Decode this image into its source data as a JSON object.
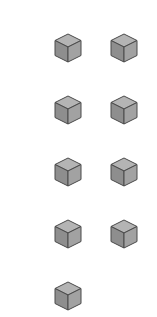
{
  "figure": {
    "cube_count": 9,
    "columns": 2,
    "rows": 5,
    "colors": {
      "top": "#b4b4b4",
      "left": "#8e8e8e",
      "right": "#a2a2a2",
      "edge": "#4a4a4a",
      "background": "#ffffff"
    },
    "cubes": [
      {
        "id": 1,
        "row": 1,
        "col": 1,
        "x": 54,
        "y": 33
      },
      {
        "id": 2,
        "row": 1,
        "col": 2,
        "x": 110,
        "y": 33
      },
      {
        "id": 3,
        "row": 2,
        "col": 1,
        "x": 54,
        "y": 95
      },
      {
        "id": 4,
        "row": 2,
        "col": 2,
        "x": 110,
        "y": 95
      },
      {
        "id": 5,
        "row": 3,
        "col": 1,
        "x": 54,
        "y": 157
      },
      {
        "id": 6,
        "row": 3,
        "col": 2,
        "x": 110,
        "y": 157
      },
      {
        "id": 7,
        "row": 4,
        "col": 1,
        "x": 54,
        "y": 219
      },
      {
        "id": 8,
        "row": 4,
        "col": 2,
        "x": 110,
        "y": 219
      },
      {
        "id": 9,
        "row": 5,
        "col": 1,
        "x": 54,
        "y": 281
      }
    ]
  }
}
